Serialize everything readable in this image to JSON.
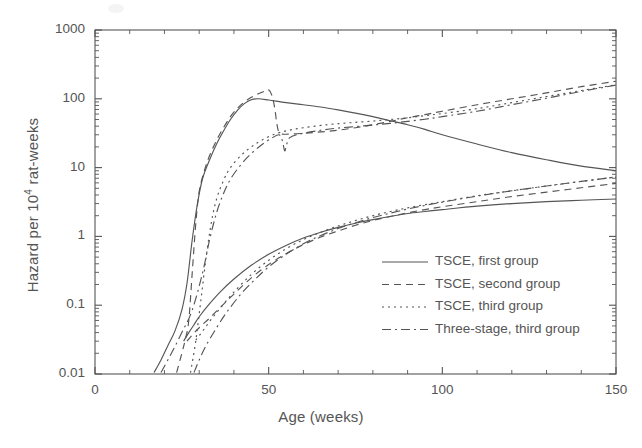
{
  "chart_data": {
    "type": "line",
    "title": "",
    "xlabel": "Age (weeks)",
    "ylabel": "Hazard per 10⁴ rat-weeks",
    "ylabel_parts": {
      "pre": "Hazard per 10",
      "sup": "4",
      "post": " rat-weeks"
    },
    "xlim": [
      0,
      150
    ],
    "ylim": [
      0.01,
      1000
    ],
    "yscale": "log",
    "xscale": "linear",
    "xticks": [
      0,
      50,
      100,
      150
    ],
    "xticklabels": [
      "0",
      "50",
      "100",
      "150"
    ],
    "yticks": [
      0.01,
      0.1,
      1,
      10,
      100,
      1000
    ],
    "yticklabels": [
      "0.01",
      "0.1",
      "1",
      "10",
      "100",
      "1000"
    ],
    "grid": false,
    "legend_position": "center-right",
    "line_color": "#555555",
    "series": [
      {
        "name": "TSCE, first group",
        "dash": "solid",
        "dasharray": "none",
        "branches": [
          {
            "branch": "upper",
            "points": [
              [
                17.0,
                0.0105
              ],
              [
                19.0,
                0.016
              ],
              [
                21.0,
                0.026
              ],
              [
                23.0,
                0.042
              ],
              [
                25.0,
                0.085
              ],
              [
                26.5,
                0.21
              ],
              [
                28.0,
                0.9
              ],
              [
                29.5,
                3.0
              ],
              [
                31.0,
                7.0
              ],
              [
                33.0,
                13.0
              ],
              [
                35.0,
                22.0
              ],
              [
                37.0,
                34.0
              ],
              [
                39.0,
                50.0
              ],
              [
                41.0,
                68.0
              ],
              [
                43.0,
                85.0
              ],
              [
                45.0,
                97.0
              ],
              [
                47.0,
                100.0
              ],
              [
                50.0,
                96.0
              ],
              [
                55.0,
                88.0
              ],
              [
                60.0,
                82.0
              ],
              [
                65.0,
                76.0
              ],
              [
                70.0,
                69.0
              ],
              [
                75.0,
                62.0
              ],
              [
                80.0,
                55.0
              ],
              [
                85.0,
                48.0
              ],
              [
                90.0,
                42.0
              ],
              [
                95.0,
                36.0
              ],
              [
                100.0,
                30.0
              ],
              [
                110.0,
                22.0
              ],
              [
                120.0,
                16.5
              ],
              [
                130.0,
                13.0
              ],
              [
                140.0,
                10.5
              ],
              [
                150.0,
                9.0
              ]
            ]
          },
          {
            "branch": "lower",
            "points": [
              [
                25.5,
                0.03
              ],
              [
                27.0,
                0.04
              ],
              [
                28.5,
                0.052
              ],
              [
                30.0,
                0.068
              ],
              [
                33.0,
                0.105
              ],
              [
                36.0,
                0.155
              ],
              [
                40.0,
                0.24
              ],
              [
                45.0,
                0.38
              ],
              [
                50.0,
                0.55
              ],
              [
                55.0,
                0.74
              ],
              [
                60.0,
                0.95
              ],
              [
                65.0,
                1.15
              ],
              [
                70.0,
                1.35
              ],
              [
                75.0,
                1.55
              ],
              [
                80.0,
                1.75
              ],
              [
                85.0,
                1.95
              ],
              [
                90.0,
                2.15
              ],
              [
                95.0,
                2.3
              ],
              [
                100.0,
                2.45
              ],
              [
                110.0,
                2.75
              ],
              [
                120.0,
                3.0
              ],
              [
                130.0,
                3.2
              ],
              [
                140.0,
                3.35
              ],
              [
                150.0,
                3.5
              ]
            ]
          }
        ]
      },
      {
        "name": "TSCE, second group",
        "dash": "dashed",
        "dasharray": "7,5",
        "branches": [
          {
            "branch": "upper",
            "points": [
              [
                23.5,
                0.0105
              ],
              [
                25.0,
                0.02
              ],
              [
                26.0,
                0.032
              ],
              [
                27.0,
                0.06
              ],
              [
                28.0,
                0.3
              ],
              [
                29.0,
                1.5
              ],
              [
                30.0,
                4.5
              ],
              [
                31.5,
                9.0
              ],
              [
                33.0,
                15.0
              ],
              [
                35.0,
                25.0
              ],
              [
                37.0,
                38.0
              ],
              [
                39.0,
                55.0
              ],
              [
                41.0,
                73.0
              ],
              [
                43.0,
                90.0
              ],
              [
                45.0,
                105.0
              ],
              [
                47.0,
                118.0
              ],
              [
                49.0,
                130.0
              ],
              [
                50.0,
                135.0
              ],
              [
                51.0,
                110.0
              ],
              [
                51.8,
                70.0
              ],
              [
                52.3,
                45.0
              ],
              [
                52.8,
                34.0
              ],
              [
                53.5,
                31.0
              ],
              [
                55.0,
                30.5
              ],
              [
                60.0,
                31.5
              ],
              [
                65.0,
                33.0
              ],
              [
                70.0,
                35.0
              ],
              [
                75.0,
                38.0
              ],
              [
                80.0,
                42.0
              ],
              [
                85.0,
                47.0
              ],
              [
                90.0,
                53.0
              ],
              [
                95.0,
                59.0
              ],
              [
                100.0,
                66.0
              ],
              [
                110.0,
                82.0
              ],
              [
                120.0,
                100.0
              ],
              [
                130.0,
                122.0
              ],
              [
                140.0,
                150.0
              ],
              [
                150.0,
                180.0
              ]
            ]
          },
          {
            "branch": "lower",
            "points": [
              [
                26.5,
                0.03
              ],
              [
                28.0,
                0.037
              ],
              [
                30.0,
                0.047
              ],
              [
                33.0,
                0.065
              ],
              [
                36.0,
                0.092
              ],
              [
                40.0,
                0.145
              ],
              [
                45.0,
                0.25
              ],
              [
                50.0,
                0.39
              ],
              [
                55.0,
                0.56
              ],
              [
                60.0,
                0.76
              ],
              [
                65.0,
                0.98
              ],
              [
                70.0,
                1.2
              ],
              [
                75.0,
                1.45
              ],
              [
                80.0,
                1.7
              ],
              [
                85.0,
                1.95
              ],
              [
                90.0,
                2.2
              ],
              [
                95.0,
                2.45
              ],
              [
                100.0,
                2.7
              ],
              [
                110.0,
                3.2
              ],
              [
                120.0,
                3.8
              ],
              [
                130.0,
                4.4
              ],
              [
                140.0,
                5.1
              ],
              [
                150.0,
                5.9
              ]
            ]
          }
        ]
      },
      {
        "name": "TSCE, third group",
        "dash": "dotted",
        "dasharray": "2,4",
        "branches": [
          {
            "branch": "upper",
            "points": [
              [
                27.5,
                0.0105
              ],
              [
                29.0,
                0.03
              ],
              [
                30.5,
                0.12
              ],
              [
                32.0,
                0.5
              ],
              [
                33.5,
                1.6
              ],
              [
                35.0,
                3.5
              ],
              [
                37.0,
                6.5
              ],
              [
                39.0,
                10.0
              ],
              [
                42.0,
                15.0
              ],
              [
                45.0,
                20.0
              ],
              [
                48.0,
                25.0
              ],
              [
                52.0,
                31.0
              ],
              [
                56.0,
                35.0
              ],
              [
                60.0,
                38.0
              ],
              [
                65.0,
                41.0
              ],
              [
                70.0,
                43.5
              ],
              [
                75.0,
                45.5
              ],
              [
                80.0,
                47.5
              ],
              [
                85.0,
                50.0
              ],
              [
                90.0,
                53.0
              ],
              [
                95.0,
                57.0
              ],
              [
                100.0,
                61.0
              ],
              [
                110.0,
                72.0
              ],
              [
                120.0,
                88.0
              ],
              [
                130.0,
                108.0
              ],
              [
                140.0,
                132.0
              ],
              [
                150.0,
                160.0
              ]
            ]
          },
          {
            "branch": "lower",
            "points": [
              [
                29.0,
                0.031
              ],
              [
                31.0,
                0.042
              ],
              [
                33.0,
                0.058
              ],
              [
                36.0,
                0.09
              ],
              [
                40.0,
                0.155
              ],
              [
                45.0,
                0.28
              ],
              [
                50.0,
                0.45
              ],
              [
                55.0,
                0.66
              ],
              [
                60.0,
                0.9
              ],
              [
                65.0,
                1.15
              ],
              [
                70.0,
                1.42
              ],
              [
                75.0,
                1.7
              ],
              [
                80.0,
                2.0
              ],
              [
                85.0,
                2.3
              ],
              [
                90.0,
                2.6
              ],
              [
                95.0,
                2.9
              ],
              [
                100.0,
                3.2
              ],
              [
                110.0,
                3.9
              ],
              [
                120.0,
                4.6
              ],
              [
                130.0,
                5.4
              ],
              [
                140.0,
                6.3
              ],
              [
                150.0,
                7.3
              ]
            ]
          }
        ]
      },
      {
        "name": "Three-stage, third group",
        "dash": "dashdot",
        "dasharray": "9,4,2,4",
        "branches": [
          {
            "branch": "upper",
            "points": [
              [
                19.0,
                0.0105
              ],
              [
                22.0,
                0.02
              ],
              [
                25.0,
                0.04
              ],
              [
                28.0,
                0.085
              ],
              [
                31.0,
                0.3
              ],
              [
                33.0,
                0.9
              ],
              [
                35.0,
                2.2
              ],
              [
                37.0,
                4.2
              ],
              [
                39.0,
                6.8
              ],
              [
                42.0,
                11.0
              ],
              [
                45.0,
                16.0
              ],
              [
                48.0,
                21.5
              ],
              [
                51.0,
                27.0
              ],
              [
                53.0,
                30.0
              ],
              [
                54.0,
                24.0
              ],
              [
                54.6,
                17.5
              ],
              [
                55.2,
                22.0
              ],
              [
                56.0,
                27.0
              ],
              [
                58.0,
                30.0
              ],
              [
                62.0,
                33.0
              ],
              [
                66.0,
                35.5
              ],
              [
                70.0,
                37.5
              ],
              [
                75.0,
                39.5
              ],
              [
                80.0,
                41.5
              ],
              [
                85.0,
                44.0
              ],
              [
                90.0,
                47.0
              ],
              [
                95.0,
                50.5
              ],
              [
                100.0,
                55.0
              ],
              [
                110.0,
                66.0
              ],
              [
                120.0,
                82.0
              ],
              [
                130.0,
                102.0
              ],
              [
                140.0,
                128.0
              ],
              [
                150.0,
                158.0
              ]
            ]
          },
          {
            "branch": "lower",
            "points": [
              [
                28.5,
                0.0105
              ],
              [
                30.0,
                0.016
              ],
              [
                32.0,
                0.026
              ],
              [
                35.0,
                0.047
              ],
              [
                38.0,
                0.08
              ],
              [
                42.0,
                0.145
              ],
              [
                46.0,
                0.235
              ],
              [
                50.0,
                0.36
              ],
              [
                55.0,
                0.55
              ],
              [
                60.0,
                0.78
              ],
              [
                65.0,
                1.03
              ],
              [
                70.0,
                1.3
              ],
              [
                75.0,
                1.58
              ],
              [
                80.0,
                1.88
              ],
              [
                85.0,
                2.18
              ],
              [
                90.0,
                2.5
              ],
              [
                95.0,
                2.82
              ],
              [
                100.0,
                3.15
              ],
              [
                110.0,
                3.85
              ],
              [
                120.0,
                4.6
              ],
              [
                130.0,
                5.4
              ],
              [
                140.0,
                6.3
              ],
              [
                150.0,
                7.3
              ]
            ]
          }
        ]
      }
    ]
  },
  "legend": {
    "items": [
      {
        "label": "TSCE, first group",
        "style": "solid"
      },
      {
        "label": "TSCE, second group",
        "style": "dashed"
      },
      {
        "label": "TSCE, third group",
        "style": "dotted"
      },
      {
        "label": "Three-stage, third group",
        "style": "dashdot"
      }
    ]
  }
}
